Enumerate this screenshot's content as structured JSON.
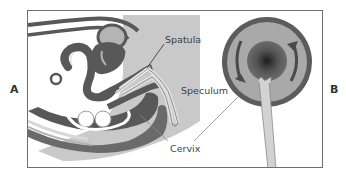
{
  "figure": {
    "panel_labels": {
      "left": "A",
      "right": "B"
    },
    "annotations": {
      "spatula": "Spatula",
      "speculum": "Speculum",
      "cervix": "Cervix"
    },
    "colors": {
      "frame": "#6e6e6e",
      "dark_tissue": "#585858",
      "mid_tissue": "#8a8a8a",
      "light_tissue": "#b4b4b4",
      "background_region": "#c9c9c9",
      "instrument": "#d6d6d6",
      "leader_line": "#8c8c8c"
    }
  }
}
